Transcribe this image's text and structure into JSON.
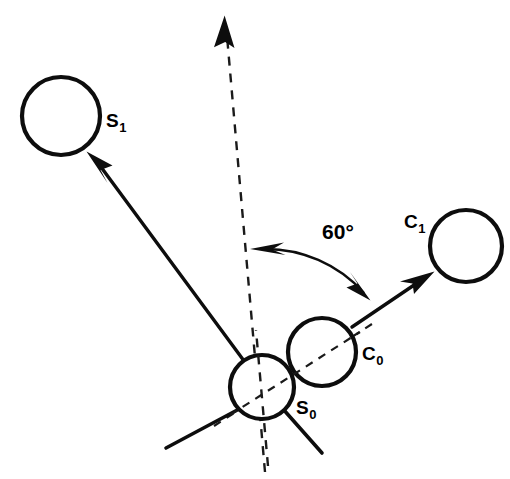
{
  "figure": {
    "background_color": "#ffffff",
    "stroke_color": "#0d0d0d",
    "width": 510,
    "height": 479
  },
  "labels": {
    "s1": {
      "base": "S",
      "sub": "1",
      "x": 106,
      "y": 127
    },
    "c1": {
      "base": "C",
      "sub": "1",
      "x": 404,
      "y": 228
    },
    "c0": {
      "base": "C",
      "sub": "0",
      "x": 362,
      "y": 360
    },
    "s0": {
      "base": "S",
      "sub": "0",
      "x": 296,
      "y": 414
    },
    "angle": {
      "text": "60°",
      "x": 338,
      "y": 239
    }
  },
  "circles": [
    {
      "name": "s1-circle",
      "label": "S1",
      "cx": 61,
      "cy": 116,
      "r": 39
    },
    {
      "name": "c1-circle",
      "label": "C1",
      "cx": 466,
      "cy": 246,
      "r": 36
    },
    {
      "name": "c0-circle",
      "label": "C0",
      "cx": 322,
      "cy": 352,
      "r": 34
    },
    {
      "name": "s0-circle",
      "label": "S0",
      "cx": 262,
      "cy": 387,
      "r": 32
    }
  ],
  "vectors": {
    "s1_arrow": {
      "name": "s1-velocity-arrow",
      "from_x": 262,
      "from_y": 387,
      "to_x": 88,
      "to_y": 152
    },
    "c1_arrow": {
      "name": "c1-velocity-arrow",
      "from_x": 322,
      "from_y": 352,
      "to_x": 433,
      "to_y": 272
    },
    "incident_axis": {
      "name": "incident-dashed-axis",
      "from_x": 265,
      "from_y": 472,
      "to_x": 224,
      "to_y": 22
    }
  },
  "guides": {
    "center_line": {
      "name": "center-to-center-dashed-line",
      "from_x": 216,
      "from_y": 425,
      "to_x": 370,
      "to_y": 325
    },
    "lower_left_ray": {
      "name": "lower-left-solid-ray",
      "from_x": 240,
      "from_y": 409,
      "to_x": 166,
      "to_y": 448
    },
    "lower_right_ray": {
      "name": "lower-right-solid-ray",
      "from_x": 283,
      "from_y": 409,
      "to_x": 322,
      "to_y": 453
    }
  },
  "angle_arc": {
    "name": "sixty-degree-arc",
    "value": "60°",
    "start_x": 252,
    "start_y": 249,
    "end_x": 368,
    "end_y": 298,
    "radius": 132
  }
}
